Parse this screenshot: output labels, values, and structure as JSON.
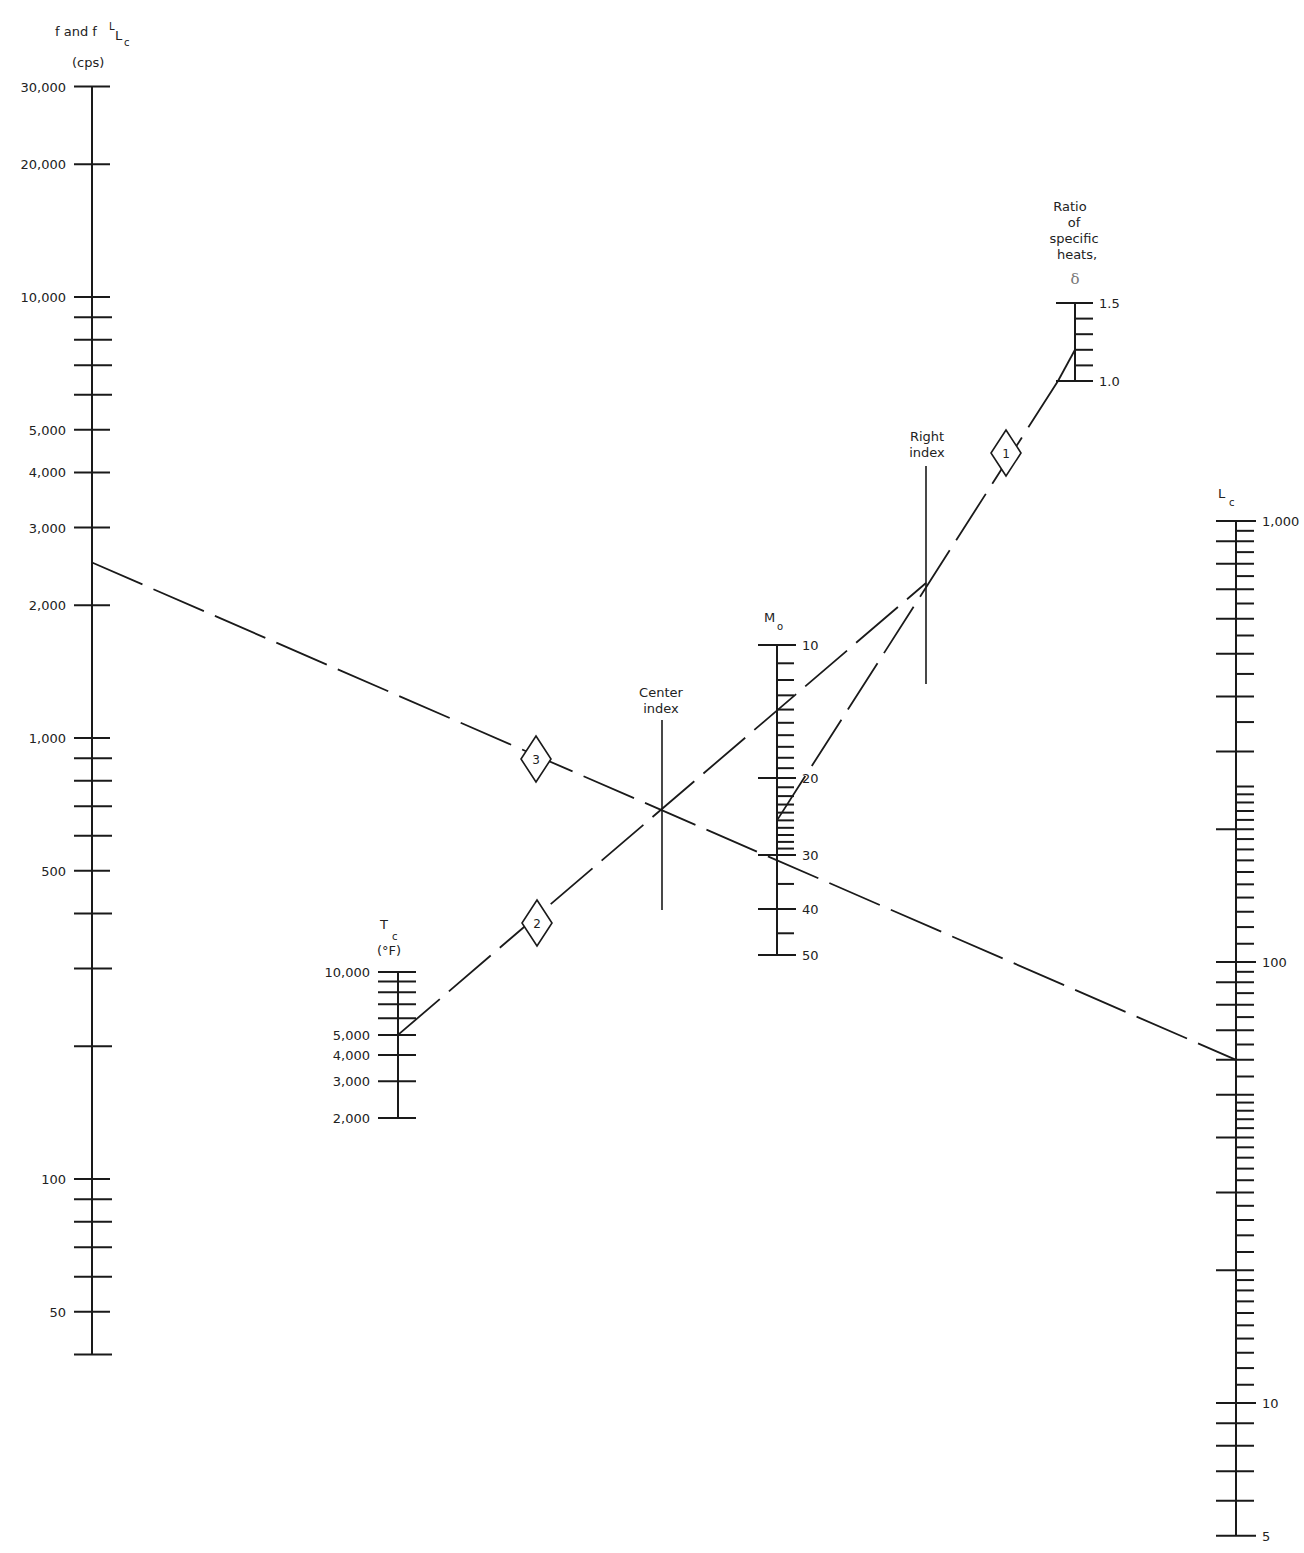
{
  "chart_data": {
    "type": "nomogram",
    "title": "",
    "scales": {
      "f": {
        "title": "f and f",
        "title_sub_sup": "L",
        "title_sub": "c",
        "units": "(cps)",
        "log": true,
        "range": [
          40,
          30000
        ],
        "labeled_ticks": [
          {
            "value": 30000,
            "label": "30,000"
          },
          {
            "value": 20000,
            "label": "20,000"
          },
          {
            "value": 10000,
            "label": "10,000"
          },
          {
            "value": 5000,
            "label": "5,000"
          },
          {
            "value": 4000,
            "label": "4,000"
          },
          {
            "value": 3000,
            "label": "3,000"
          },
          {
            "value": 2000,
            "label": "2,000"
          },
          {
            "value": 1000,
            "label": "1,000"
          },
          {
            "value": 500,
            "label": "500"
          },
          {
            "value": 100,
            "label": "100"
          },
          {
            "value": 50,
            "label": "50"
          }
        ],
        "minor_ticks": [
          9000,
          8000,
          7000,
          6000,
          900,
          800,
          700,
          600,
          400,
          300,
          200,
          90,
          80,
          70,
          60,
          40
        ]
      },
      "Tc": {
        "title": "T",
        "title_sub": "c",
        "units": "(°F)",
        "log": true,
        "range": [
          2000,
          10000
        ],
        "labeled_ticks": [
          {
            "value": 10000,
            "label": "10,000"
          },
          {
            "value": 5000,
            "label": "5,000"
          },
          {
            "value": 4000,
            "label": "4,000"
          },
          {
            "value": 3000,
            "label": "3,000"
          },
          {
            "value": 2000,
            "label": "2,000"
          }
        ],
        "minor_ticks": [
          9000,
          8000,
          7000,
          6000
        ]
      },
      "center_index": {
        "title_line1": "Center",
        "title_line2": "index"
      },
      "M0": {
        "title": "M",
        "title_sub": "o",
        "range": [
          10,
          50
        ],
        "labeled_ticks": [
          {
            "value": 10,
            "label": "10"
          },
          {
            "value": 20,
            "label": "20"
          },
          {
            "value": 30,
            "label": "30"
          },
          {
            "value": 40,
            "label": "40"
          },
          {
            "value": 50,
            "label": "50"
          }
        ],
        "minor_ticks": [
          11,
          12,
          13,
          14,
          15,
          16,
          17,
          18,
          19,
          21,
          22,
          23,
          24,
          25,
          26,
          27,
          28,
          29,
          35,
          45
        ]
      },
      "right_index": {
        "title_line1": "Right",
        "title_line2": "index"
      },
      "delta": {
        "title_lines": [
          "Ratio",
          "of",
          "specific",
          "heats,"
        ],
        "symbol": "δ",
        "range": [
          1.0,
          1.5
        ],
        "labeled_ticks": [
          {
            "value": 1.5,
            "label": "1.5"
          },
          {
            "value": 1.0,
            "label": "1.0"
          }
        ],
        "minor_ticks": [
          1.1,
          1.2,
          1.3,
          1.4
        ]
      },
      "Lc": {
        "title": "L",
        "title_sub": "c",
        "log": true,
        "range": [
          5,
          1000
        ],
        "labeled_ticks": [
          {
            "value": 1000,
            "label": "1,000"
          },
          {
            "value": 100,
            "label": "100"
          },
          {
            "value": 10,
            "label": "10"
          },
          {
            "value": 5,
            "label": "5"
          }
        ],
        "major_unlabeled": [
          900,
          800,
          700,
          600,
          500,
          400,
          300,
          200,
          90,
          80,
          70,
          60,
          50,
          40,
          30,
          20,
          9,
          8,
          7,
          6
        ],
        "minor_ticks": [
          950,
          850,
          750,
          650,
          550,
          450,
          350,
          250,
          240,
          230,
          220,
          210,
          190,
          180,
          170,
          160,
          150,
          140,
          130,
          120,
          110,
          95,
          85,
          75,
          65,
          55,
          48,
          46,
          44,
          42,
          38,
          36,
          34,
          32,
          28,
          26,
          24,
          22,
          19,
          18,
          17,
          16,
          15,
          14,
          13,
          12,
          11
        ]
      }
    },
    "solution_lines": [
      {
        "step": "1",
        "from": {
          "scale": "delta",
          "value": 1.2
        },
        "to": {
          "scale": "M0",
          "value": 25
        },
        "through": "right_index"
      },
      {
        "step": "2",
        "from": {
          "scale": "Tc",
          "value": 5000
        },
        "to": {
          "scale": "right_index"
        },
        "through": "center_index"
      },
      {
        "step": "3",
        "from": {
          "scale": "f",
          "value": 2500
        },
        "to": {
          "scale": "Lc",
          "value": 60
        },
        "through": "center_index"
      }
    ],
    "markers": [
      "1",
      "2",
      "3"
    ]
  }
}
